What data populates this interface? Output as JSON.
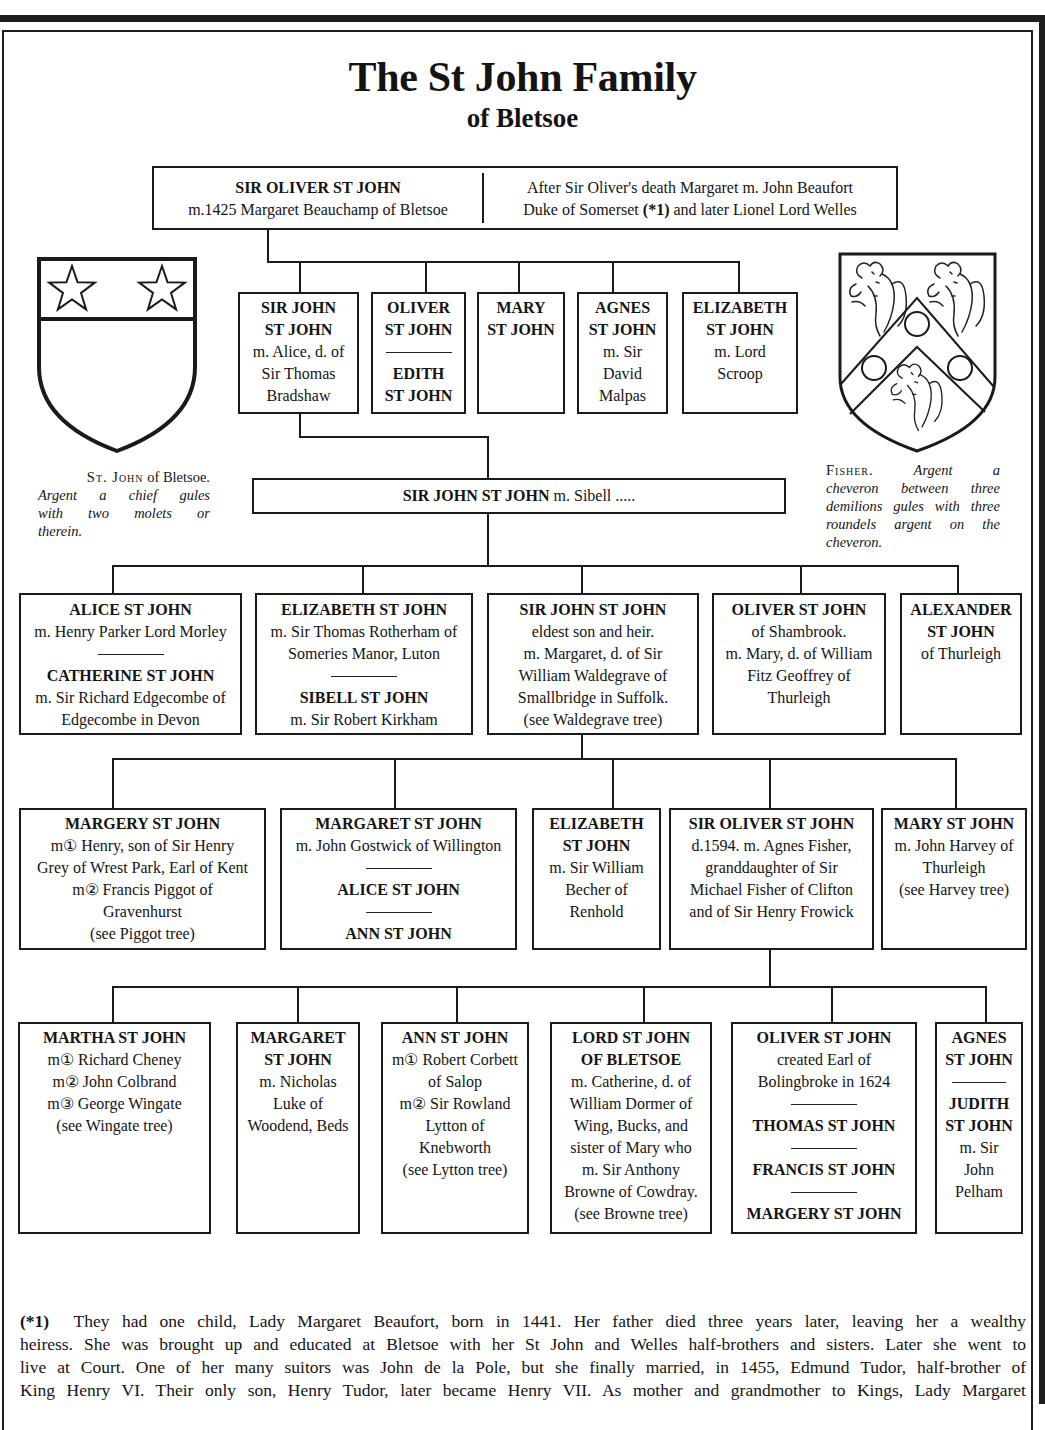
{
  "title": "The St John Family",
  "subtitle": "of Bletsoe",
  "root": {
    "name": "SIR OLIVER ST JOHN",
    "marriage": "m.1425 Margaret Beauchamp of Bletsoe",
    "note_line1": "After Sir Oliver's death Margaret m. John Beaufort",
    "note_line2_pre": "Duke of Somerset ",
    "note_ref": "(*1)",
    "note_line2_post": " and later Lionel Lord Welles"
  },
  "arms": {
    "st_john": {
      "caption_name": "St. John",
      "caption_rest": " of Bletsoe.",
      "blazon_lines": [
        "Argent a chief gules",
        "with two molets or",
        "therein."
      ]
    },
    "fisher": {
      "caption_name": "Fisher.",
      "caption_first": "Argent a",
      "blazon_lines": [
        "cheveron between three",
        "demilions gules with three",
        "roundels argent on the",
        "cheveron."
      ]
    }
  },
  "heir": {
    "name": "SIR JOHN ST JOHN",
    "marriage": " m. Sibell ....."
  },
  "generations": [
    {
      "boxes": [
        {
          "people": [
            {
              "name": [
                "SIR JOHN",
                "ST JOHN"
              ],
              "details": [
                "m. Alice, d. of",
                "Sir Thomas",
                "Bradshaw"
              ]
            }
          ]
        },
        {
          "people": [
            {
              "name": [
                "OLIVER",
                "ST JOHN"
              ],
              "details": []
            },
            {
              "name": [
                "EDITH",
                "ST JOHN"
              ],
              "details": []
            }
          ]
        },
        {
          "people": [
            {
              "name": [
                "MARY",
                "ST JOHN"
              ],
              "details": []
            }
          ]
        },
        {
          "people": [
            {
              "name": [
                "AGNES",
                "ST JOHN"
              ],
              "details": [
                "m. Sir",
                "David",
                "Malpas"
              ]
            }
          ]
        },
        {
          "people": [
            {
              "name": [
                "ELIZABETH",
                "ST JOHN"
              ],
              "details": [
                "m. Lord",
                "Scroop"
              ]
            }
          ]
        }
      ]
    },
    {
      "boxes": [
        {
          "people": [
            {
              "name": [
                "ALICE ST JOHN"
              ],
              "details": [
                "m. Henry Parker Lord Morley"
              ]
            },
            {
              "name": [
                "CATHERINE ST JOHN"
              ],
              "details": [
                "m. Sir Richard Edgecombe of",
                "Edgecombe in Devon"
              ]
            }
          ]
        },
        {
          "people": [
            {
              "name": [
                "ELIZABETH ST JOHN"
              ],
              "details": [
                "m. Sir Thomas Rotherham of",
                "Someries Manor, Luton"
              ]
            },
            {
              "name": [
                "SIBELL ST JOHN"
              ],
              "details": [
                "m. Sir Robert Kirkham"
              ]
            }
          ]
        },
        {
          "people": [
            {
              "name": [
                "SIR JOHN ST JOHN"
              ],
              "details": [
                "eldest son and heir.",
                "m. Margaret, d. of Sir",
                "William Waldegrave of",
                "Smallbridge in Suffolk.",
                "(see Waldegrave tree)"
              ]
            }
          ]
        },
        {
          "people": [
            {
              "name": [
                "OLIVER ST JOHN"
              ],
              "details": [
                "of Shambrook.",
                "m. Mary, d. of William",
                "Fitz Geoffrey of",
                "Thurleigh"
              ]
            }
          ]
        },
        {
          "people": [
            {
              "name": [
                "ALEXANDER",
                "ST JOHN"
              ],
              "details": [
                "of Thurleigh"
              ]
            }
          ]
        }
      ]
    },
    {
      "boxes": [
        {
          "people": [
            {
              "name": [
                "MARGERY ST JOHN"
              ],
              "details": [
                "m① Henry, son of Sir Henry",
                "Grey of Wrest Park, Earl of Kent",
                "m② Francis Piggot of",
                "Gravenhurst",
                "(see Piggot tree)"
              ]
            }
          ]
        },
        {
          "people": [
            {
              "name": [
                "MARGARET ST JOHN"
              ],
              "details": [
                "m. John Gostwick of Willington"
              ]
            },
            {
              "name": [
                "ALICE ST JOHN"
              ],
              "details": []
            },
            {
              "name": [
                "ANN ST JOHN"
              ],
              "details": []
            }
          ]
        },
        {
          "people": [
            {
              "name": [
                "ELIZABETH",
                "ST JOHN"
              ],
              "details": [
                "m. Sir William",
                "Becher of",
                "Renhold"
              ]
            }
          ]
        },
        {
          "people": [
            {
              "name": [
                "SIR OLIVER ST JOHN"
              ],
              "details": [
                "d.1594. m. Agnes Fisher,",
                "granddaughter of Sir",
                "Michael Fisher of Clifton",
                "and of Sir Henry Frowick"
              ]
            }
          ]
        },
        {
          "people": [
            {
              "name": [
                "MARY ST JOHN"
              ],
              "details": [
                "m. John Harvey of",
                "Thurleigh",
                "(see Harvey tree)"
              ]
            }
          ]
        }
      ]
    },
    {
      "boxes": [
        {
          "people": [
            {
              "name": [
                "MARTHA ST JOHN"
              ],
              "details": [
                "m① Richard Cheney",
                "m② John Colbrand",
                "m③ George Wingate",
                "(see Wingate tree)"
              ]
            }
          ]
        },
        {
          "people": [
            {
              "name": [
                "MARGARET",
                "ST JOHN"
              ],
              "details": [
                "m. Nicholas",
                "Luke of",
                "Woodend, Beds"
              ]
            }
          ]
        },
        {
          "people": [
            {
              "name": [
                "ANN ST JOHN"
              ],
              "details": [
                "m① Robert Corbett",
                "of Salop",
                "m② Sir Rowland",
                "Lytton of",
                "Knebworth",
                "(see Lytton tree)"
              ]
            }
          ]
        },
        {
          "people": [
            {
              "name": [
                "LORD ST JOHN",
                "OF BLETSOE"
              ],
              "details": [
                "m. Catherine, d. of",
                "William Dormer of",
                "Wing, Bucks, and",
                "sister of Mary who",
                "m. Sir Anthony",
                "Browne of Cowdray.",
                "(see Browne tree)"
              ]
            }
          ]
        },
        {
          "people": [
            {
              "name": [
                "OLIVER ST JOHN"
              ],
              "details": [
                "created Earl of",
                "Bolingbroke in 1624"
              ]
            },
            {
              "name": [
                "THOMAS ST JOHN"
              ],
              "details": []
            },
            {
              "name": [
                "FRANCIS ST JOHN"
              ],
              "details": []
            },
            {
              "name": [
                "MARGERY ST JOHN"
              ],
              "details": []
            }
          ]
        },
        {
          "people": [
            {
              "name": [
                "AGNES",
                "ST JOHN"
              ],
              "details": []
            },
            {
              "name": [
                "JUDITH",
                "ST JOHN"
              ],
              "details": [
                "m. Sir",
                "John",
                "Pelham"
              ]
            }
          ]
        }
      ]
    }
  ],
  "footnote": {
    "ref": "(*1)",
    "lines": [
      "  They had one child, Lady Margaret Beaufort, born in 1441. Her father died three years later, leaving her a wealthy",
      "heiress. She was brought up and  educated at Bletsoe with her St John and Welles half-brothers and sisters. Later she went to",
      "live at Court. One of her many suitors was John de la Pole, but she finally married, in 1455, Edmund Tudor, half-brother of",
      "King Henry VI. Their only son, Henry Tudor, later became Henry VII. As mother and grandmother to Kings, Lady Margaret"
    ]
  }
}
